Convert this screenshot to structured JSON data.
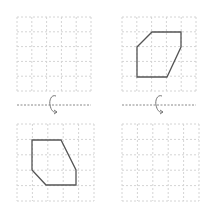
{
  "colors": {
    "grid": "#d4d4d4",
    "shape": "#555555",
    "axis": "#888888",
    "arrow": "#777777",
    "background": "#ffffff"
  },
  "panels": [
    {
      "name": "top-left",
      "x": 17,
      "y": 17,
      "size": 74,
      "cells": 5,
      "shape": null
    },
    {
      "name": "top-right",
      "x": 122,
      "y": 17,
      "size": 74,
      "cells": 5,
      "shape": "137,47 152,32 181,32 181,47 167,77 137,77"
    },
    {
      "name": "bottom-left",
      "x": 17,
      "y": 124,
      "size": 77,
      "cells": 5,
      "shape": "32,140 61,140 76,170 76,185 46,185 32,170"
    },
    {
      "name": "bottom-right",
      "x": 122,
      "y": 124,
      "size": 77,
      "cells": 5,
      "shape": null
    }
  ],
  "axes": [
    {
      "name": "left-rotation-axis",
      "x1": 17,
      "x2": 91,
      "y": 105,
      "arrow_x": 52,
      "arrow": "rotate-around-horizontal-axis"
    },
    {
      "name": "right-rotation-axis",
      "x1": 122,
      "x2": 196,
      "y": 105,
      "arrow_x": 158,
      "arrow": "rotate-around-horizontal-axis"
    }
  ]
}
